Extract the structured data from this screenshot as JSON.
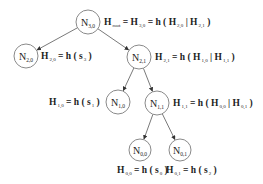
{
  "diagram": {
    "type": "binary-hash-tree",
    "colors": {
      "stroke": "#8a8a8a",
      "edge": "#6a6a6a",
      "text": "#222222",
      "background": "#ffffff"
    },
    "nodes": [
      {
        "id": "N3,0",
        "base": "N",
        "sub": "3,0",
        "cx": 88,
        "cy": 22,
        "r": 12,
        "label": {
          "x": 104,
          "y": 25,
          "parts": [
            {
              "t": "H"
            },
            {
              "s": "root"
            },
            {
              "t": " = H"
            },
            {
              "s": "3,0"
            },
            {
              "t": " = h ( H"
            },
            {
              "s": "2,0"
            },
            {
              "t": " | H"
            },
            {
              "s": "2,1"
            },
            {
              "t": " )"
            }
          ]
        }
      },
      {
        "id": "N2,0",
        "base": "N",
        "sub": "2,0",
        "cx": 26,
        "cy": 56,
        "r": 12,
        "label": {
          "x": 41,
          "y": 59,
          "parts": [
            {
              "t": "H"
            },
            {
              "s": "2,0"
            },
            {
              "t": " = h ( s"
            },
            {
              "s": "3"
            },
            {
              "t": " )"
            }
          ]
        }
      },
      {
        "id": "N2,1",
        "base": "N",
        "sub": "2,1",
        "cx": 139,
        "cy": 57,
        "r": 12,
        "label": {
          "x": 155,
          "y": 60,
          "parts": [
            {
              "t": "H"
            },
            {
              "s": "2,1"
            },
            {
              "t": " = h ( H"
            },
            {
              "s": "1,0"
            },
            {
              "t": " | H"
            },
            {
              "s": "1,1"
            },
            {
              "t": " )"
            }
          ]
        }
      },
      {
        "id": "N1,0",
        "base": "N",
        "sub": "1,0",
        "cx": 118,
        "cy": 102,
        "r": 12,
        "label": {
          "x": 49,
          "y": 105,
          "parts": [
            {
              "t": "H"
            },
            {
              "s": "1,0"
            },
            {
              "t": " = h ( s"
            },
            {
              "s": "1"
            },
            {
              "t": " )"
            }
          ]
        }
      },
      {
        "id": "N1,1",
        "base": "N",
        "sub": "1,1",
        "cx": 157,
        "cy": 103,
        "r": 12,
        "label": {
          "x": 173,
          "y": 106,
          "parts": [
            {
              "t": "H"
            },
            {
              "s": "1,1"
            },
            {
              "t": " = h ( H"
            },
            {
              "s": "0,0"
            },
            {
              "t": " | H"
            },
            {
              "s": "0,1"
            },
            {
              "t": " )"
            }
          ]
        }
      },
      {
        "id": "N0,0",
        "base": "N",
        "sub": "0,0",
        "cx": 140,
        "cy": 150,
        "r": 11,
        "label": {
          "x": 117,
          "y": 173,
          "parts": [
            {
              "t": "H"
            },
            {
              "s": "0,0"
            },
            {
              "t": " = h ( s"
            },
            {
              "s": "0"
            },
            {
              "t": " )"
            }
          ]
        }
      },
      {
        "id": "N0,1",
        "base": "N",
        "sub": "0,1",
        "cx": 180,
        "cy": 150,
        "r": 11,
        "label": {
          "x": 166,
          "y": 173,
          "parts": [
            {
              "t": "H"
            },
            {
              "s": "0,1"
            },
            {
              "t": " = h ( s"
            },
            {
              "s": "2"
            },
            {
              "t": " )"
            }
          ]
        }
      }
    ],
    "edges": [
      {
        "from": "N3,0",
        "to": "N2,0"
      },
      {
        "from": "N3,0",
        "to": "N2,1"
      },
      {
        "from": "N2,1",
        "to": "N1,0"
      },
      {
        "from": "N2,1",
        "to": "N1,1"
      },
      {
        "from": "N1,1",
        "to": "N0,0"
      },
      {
        "from": "N1,1",
        "to": "N0,1"
      }
    ]
  }
}
